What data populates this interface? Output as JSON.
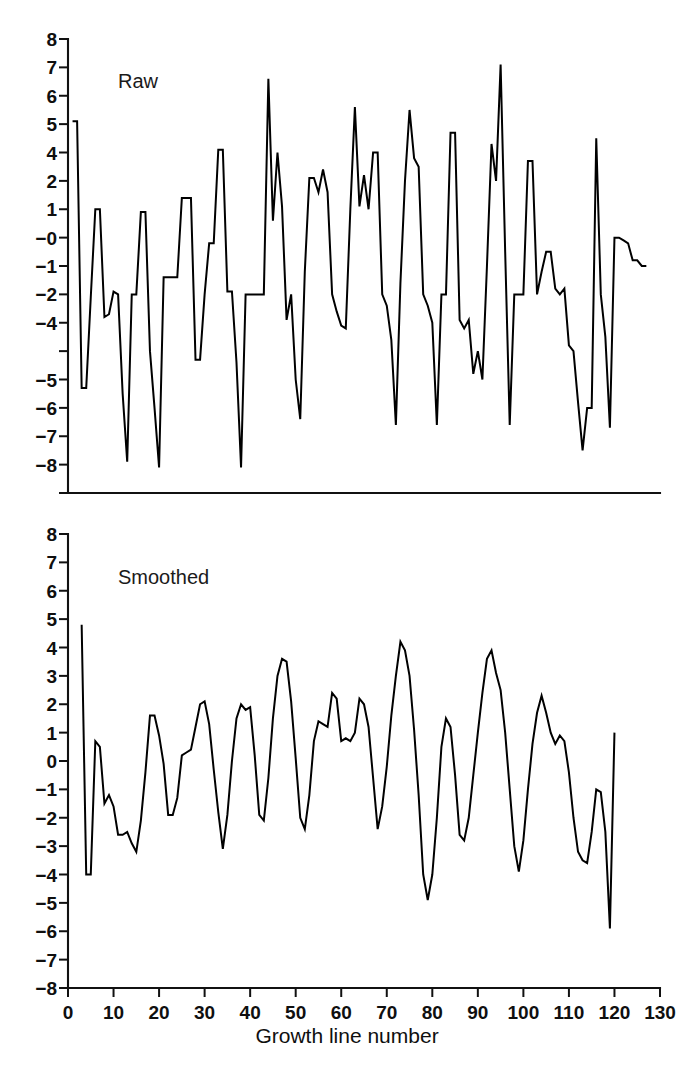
{
  "figure": {
    "background_color": "#ffffff",
    "line_color": "#000000",
    "text_color": "#111111",
    "xlabel": "Growth line number"
  },
  "chart_data": [
    {
      "type": "line",
      "title": "Raw",
      "panel": "top",
      "xlabel": "",
      "ylabel": "",
      "xlim": [
        0,
        130
      ],
      "ylim": [
        -8,
        8
      ],
      "grid": false,
      "legend": "none",
      "x_ticks": [
        0,
        10,
        20,
        30,
        40,
        50,
        60,
        70,
        80,
        90,
        100,
        110,
        120,
        130
      ],
      "x_tick_labels": [
        "",
        "",
        "",
        "",
        "",
        "",
        "",
        "",
        "",
        "",
        "",
        "",
        "",
        ""
      ],
      "y_ticks": [
        8,
        7,
        6,
        5,
        4,
        3,
        2,
        1,
        0,
        -1,
        -2,
        -3,
        -4,
        -5,
        -6,
        -7,
        -8
      ],
      "y_tick_labels": [
        "8",
        "7",
        "6",
        "5",
        "4",
        "2",
        "1",
        "-0",
        "-1",
        "-2",
        "-4",
        "-5",
        "-6",
        "-7",
        "-8"
      ],
      "y_tick_label_positions": [
        8,
        7,
        6,
        5,
        4,
        3,
        2,
        1,
        0,
        -1,
        -2,
        -4,
        -5,
        -6,
        -7,
        -8
      ],
      "x": [
        1,
        2,
        3,
        4,
        5,
        6,
        7,
        8,
        9,
        10,
        11,
        12,
        13,
        14,
        15,
        16,
        17,
        18,
        19,
        20,
        21,
        22,
        23,
        24,
        25,
        26,
        27,
        28,
        29,
        30,
        31,
        32,
        33,
        34,
        35,
        36,
        37,
        38,
        39,
        40,
        41,
        42,
        43,
        44,
        45,
        46,
        47,
        48,
        49,
        50,
        51,
        52,
        53,
        54,
        55,
        56,
        57,
        58,
        59,
        60,
        61,
        62,
        63,
        64,
        65,
        66,
        67,
        68,
        69,
        70,
        71,
        72,
        73,
        74,
        75,
        76,
        77,
        78,
        79,
        80,
        81,
        82,
        83,
        84,
        85,
        86,
        87,
        88,
        89,
        90,
        91,
        92,
        93,
        94,
        95,
        96,
        97,
        98,
        99,
        100,
        101,
        102,
        103,
        104,
        105,
        106,
        107,
        108,
        109,
        110,
        111,
        112,
        113,
        114,
        115,
        116,
        117,
        118,
        119,
        120,
        121,
        122,
        123,
        124,
        125,
        126,
        127,
        128
      ],
      "values": [
        5.1,
        5.1,
        -4.3,
        -4.3,
        -1.1,
        2.0,
        2.0,
        -1.8,
        -1.7,
        -0.9,
        -1.0,
        -4.5,
        -6.9,
        -1.0,
        -1.0,
        1.9,
        1.9,
        -3.0,
        -5.0,
        -7.1,
        -0.4,
        -0.4,
        -0.4,
        -0.4,
        2.4,
        2.4,
        2.4,
        -3.3,
        -3.3,
        -1.0,
        0.8,
        0.8,
        4.1,
        4.1,
        -0.9,
        -0.9,
        -3.4,
        -7.1,
        -1.0,
        -1.0,
        -1.0,
        -1.0,
        -1.0,
        6.6,
        1.6,
        4.0,
        2.1,
        -1.9,
        -1.0,
        -4.0,
        -5.4,
        -0.2,
        3.1,
        3.1,
        2.6,
        3.4,
        2.6,
        -1.0,
        -1.6,
        -2.1,
        -2.2,
        2.0,
        5.6,
        2.1,
        3.2,
        2.0,
        4.0,
        4.0,
        -1.0,
        -1.4,
        -2.6,
        -5.6,
        -0.6,
        3.0,
        5.5,
        3.8,
        3.5,
        -1.0,
        -1.4,
        -2.0,
        -5.6,
        -1.0,
        -1.0,
        4.7,
        4.7,
        -1.9,
        -2.2,
        -1.9,
        -3.8,
        -3.0,
        -4.0,
        0.0,
        4.3,
        3.0,
        7.1,
        0.5,
        -5.6,
        -1.0,
        -1.0,
        -1.0,
        3.7,
        3.7,
        -1.0,
        -0.2,
        0.5,
        0.5,
        -0.8,
        -1.0,
        -0.8,
        -2.8,
        -3.0,
        -4.8,
        -6.5,
        -5.0,
        -5.0,
        4.5,
        -1.0,
        -2.5,
        -5.7,
        1.0,
        1.0,
        0.9,
        0.8,
        0.2,
        0.2,
        0.0,
        0.0
      ]
    },
    {
      "type": "line",
      "title": "Smoothed",
      "panel": "bottom",
      "xlabel": "Growth line number",
      "ylabel": "",
      "xlim": [
        0,
        130
      ],
      "ylim": [
        -8,
        8
      ],
      "grid": false,
      "legend": "none",
      "x_ticks": [
        0,
        10,
        20,
        30,
        40,
        50,
        60,
        70,
        80,
        90,
        100,
        110,
        120,
        130
      ],
      "x_tick_labels": [
        "0",
        "10",
        "20",
        "30",
        "40",
        "50",
        "60",
        "70",
        "80",
        "90",
        "100",
        "110",
        "120",
        "130"
      ],
      "y_ticks": [
        8,
        7,
        6,
        5,
        4,
        3,
        2,
        1,
        0,
        -1,
        -2,
        -3,
        -4,
        -5,
        -6,
        -7,
        -8
      ],
      "y_tick_labels": [
        "8",
        "7",
        "6",
        "5",
        "4",
        "3",
        "2",
        "1",
        "0",
        "-1",
        "-2",
        "-3",
        "-4",
        "-5",
        "-6",
        "-7",
        "-8"
      ],
      "x": [
        3,
        4,
        5,
        6,
        7,
        8,
        9,
        10,
        11,
        12,
        13,
        14,
        15,
        16,
        17,
        18,
        19,
        20,
        21,
        22,
        23,
        24,
        25,
        26,
        27,
        28,
        29,
        30,
        31,
        32,
        33,
        34,
        35,
        36,
        37,
        38,
        39,
        40,
        41,
        42,
        43,
        44,
        45,
        46,
        47,
        48,
        49,
        50,
        51,
        52,
        53,
        54,
        55,
        56,
        57,
        58,
        59,
        60,
        61,
        62,
        63,
        64,
        65,
        66,
        67,
        68,
        69,
        70,
        71,
        72,
        73,
        74,
        75,
        76,
        77,
        78,
        79,
        80,
        81,
        82,
        83,
        84,
        85,
        86,
        87,
        88,
        89,
        90,
        91,
        92,
        93,
        94,
        95,
        96,
        97,
        98,
        99,
        100,
        101,
        102,
        103,
        104,
        105,
        106,
        107,
        108,
        109,
        110,
        111,
        112,
        113,
        114,
        115,
        116,
        117,
        118,
        119,
        120,
        121,
        122,
        123,
        124,
        125,
        126,
        127
      ],
      "values": [
        4.8,
        -4.0,
        -4.0,
        0.7,
        0.5,
        -1.5,
        -1.2,
        -1.6,
        -2.6,
        -2.6,
        -2.5,
        -2.9,
        -3.2,
        -2.1,
        -0.4,
        1.6,
        1.6,
        0.9,
        -0.1,
        -1.9,
        -1.9,
        -1.3,
        0.2,
        0.3,
        0.4,
        1.2,
        2.0,
        2.1,
        1.3,
        -0.3,
        -1.8,
        -3.1,
        -1.9,
        0.0,
        1.5,
        2.0,
        1.8,
        1.9,
        0.2,
        -1.9,
        -2.1,
        -0.6,
        1.5,
        3.0,
        3.6,
        3.5,
        2.1,
        0.1,
        -2.0,
        -2.4,
        -1.2,
        0.7,
        1.4,
        1.3,
        1.2,
        2.4,
        2.2,
        0.7,
        0.8,
        0.7,
        1.0,
        2.2,
        2.0,
        1.2,
        -0.6,
        -2.4,
        -1.6,
        -0.2,
        1.6,
        3.0,
        4.2,
        3.9,
        3.0,
        1.1,
        -1.2,
        -4.0,
        -4.9,
        -4.0,
        -2.0,
        0.5,
        1.5,
        1.2,
        -0.5,
        -2.6,
        -2.8,
        -2.0,
        -0.5,
        1.0,
        2.4,
        3.6,
        3.9,
        3.1,
        2.5,
        1.0,
        -1.0,
        -3.0,
        -3.9,
        -2.8,
        -1.0,
        0.6,
        1.7,
        2.3,
        1.7,
        1.0,
        0.6,
        0.9,
        0.7,
        -0.4,
        -2.0,
        -3.2,
        -3.5,
        -3.6,
        -2.5,
        -1.0,
        -1.1,
        -2.5,
        -5.9,
        1.0
      ]
    }
  ]
}
